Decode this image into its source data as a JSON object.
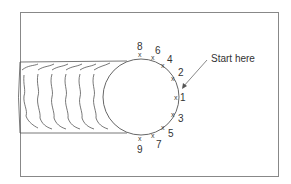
{
  "diagram": {
    "type": "weld-tack-sequence",
    "annotation": "Start here",
    "colors": {
      "line": "#555555",
      "frame": "#888888",
      "text": "#333333",
      "background": "#ffffff"
    },
    "circle": {
      "cx": 141,
      "cy": 97,
      "r": 38
    },
    "points": [
      {
        "label": "1",
        "x": 176,
        "y": 97,
        "lx": 180,
        "ly": 101
      },
      {
        "label": "2",
        "x": 173,
        "y": 78,
        "lx": 178,
        "ly": 76
      },
      {
        "label": "3",
        "x": 173,
        "y": 114,
        "lx": 178,
        "ly": 122
      },
      {
        "label": "4",
        "x": 163,
        "y": 65,
        "lx": 167,
        "ly": 63
      },
      {
        "label": "5",
        "x": 163,
        "y": 127,
        "lx": 168,
        "ly": 137
      },
      {
        "label": "6",
        "x": 153,
        "y": 57,
        "lx": 155,
        "ly": 54
      },
      {
        "label": "7",
        "x": 153,
        "y": 135,
        "lx": 156,
        "ly": 148
      },
      {
        "label": "8",
        "x": 140,
        "y": 54,
        "lx": 137,
        "ly": 50
      },
      {
        "label": "9",
        "x": 140,
        "y": 138,
        "lx": 137,
        "ly": 153
      }
    ]
  }
}
